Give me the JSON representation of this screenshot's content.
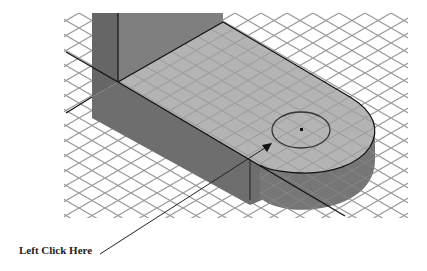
{
  "diagram": {
    "type": "isometric-cad-view",
    "callout": {
      "label": "Left Click Here",
      "target": "hole-edge-circle"
    },
    "colors": {
      "background": "#ffffff",
      "grid": "#9a9a9a",
      "top_face": "#b4b4b4",
      "side_face": "#6e6e6e",
      "wall_front": "#7f7f7f",
      "wall_side": "#666666",
      "edge": "#111111"
    }
  }
}
